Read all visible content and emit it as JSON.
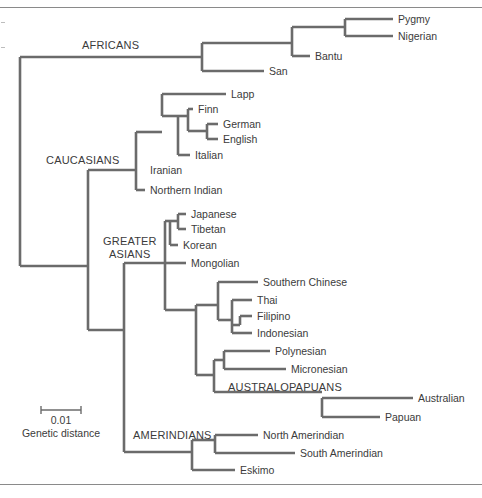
{
  "figure": {
    "width": 482,
    "height": 498,
    "line_color": "#6b6b6b",
    "text_color": "#3b3b3b",
    "rule_color": "#8a8a8a",
    "background": "#ffffff"
  },
  "scale_bar": {
    "value_label": "0.01",
    "caption": "Genetic distance",
    "x_start": 41,
    "x_end": 81,
    "y": 410,
    "value_label_y": 424,
    "caption_y": 437
  },
  "group_labels": [
    {
      "id": "africans",
      "text": "AFRICANS",
      "x": 82,
      "y": 49
    },
    {
      "id": "caucasians",
      "text": "CAUCASIANS",
      "x": 46,
      "y": 164
    },
    {
      "id": "greater-asians-line1",
      "text": "GREATER",
      "x": 103,
      "y": 245
    },
    {
      "id": "greater-asians-line2",
      "text": "ASIANS",
      "x": 109,
      "y": 258
    },
    {
      "id": "australopapuans",
      "text": "AUSTRALOPAPUANS",
      "x": 228,
      "y": 391
    },
    {
      "id": "amerindians",
      "text": "AMERINDIANS",
      "x": 133,
      "y": 439
    }
  ],
  "chart_data": {
    "type": "tree",
    "scale": {
      "bar_length_px": 40,
      "bar_value": 0.01,
      "units": "genetic distance"
    },
    "root": {
      "x": 20,
      "y_top": 57,
      "y_bottom": 266
    },
    "clades": [
      "AFRICANS",
      "CAUCASIANS",
      "GREATER ASIANS",
      "AUSTRALOPAPUANS",
      "AMERINDIANS"
    ],
    "taxa": [
      {
        "name": "Pygmy",
        "group": "AFRICANS",
        "tip_x": 393,
        "y": 19,
        "branch_x": 345,
        "label_x": 398
      },
      {
        "name": "Nigerian",
        "group": "AFRICANS",
        "tip_x": 393,
        "y": 36,
        "branch_x": 345,
        "label_x": 398
      },
      {
        "name": "Bantu",
        "group": "AFRICANS",
        "tip_x": 310,
        "y": 56,
        "branch_x": 292,
        "label_x": 315
      },
      {
        "name": "San",
        "group": "AFRICANS",
        "tip_x": 264,
        "y": 71,
        "branch_x": 202,
        "label_x": 269
      },
      {
        "name": "Lapp",
        "group": "CAUCASIANS",
        "tip_x": 226,
        "y": 94,
        "branch_x": 162,
        "label_x": 231
      },
      {
        "name": "Finn",
        "group": "CAUCASIANS",
        "tip_x": 193,
        "y": 109,
        "branch_x": 188,
        "label_x": 198
      },
      {
        "name": "German",
        "group": "CAUCASIANS",
        "tip_x": 218,
        "y": 124,
        "branch_x": 207,
        "label_x": 223
      },
      {
        "name": "English",
        "group": "CAUCASIANS",
        "tip_x": 218,
        "y": 139,
        "branch_x": 207,
        "label_x": 223
      },
      {
        "name": "Italian",
        "group": "CAUCASIANS",
        "tip_x": 190,
        "y": 155,
        "branch_x": 178,
        "label_x": 195
      },
      {
        "name": "Iranian",
        "group": "CAUCASIANS",
        "tip_x": 145,
        "y": 170,
        "branch_x": 136,
        "label_x": 150
      },
      {
        "name": "Northern Indian",
        "group": "CAUCASIANS",
        "tip_x": 145,
        "y": 190,
        "branch_x": 136,
        "label_x": 150
      },
      {
        "name": "Japanese",
        "group": "GREATER ASIANS",
        "tip_x": 186,
        "y": 214,
        "branch_x": 178,
        "label_x": 191
      },
      {
        "name": "Tibetan",
        "group": "GREATER ASIANS",
        "tip_x": 186,
        "y": 229,
        "branch_x": 178,
        "label_x": 191
      },
      {
        "name": "Korean",
        "group": "GREATER ASIANS",
        "tip_x": 178,
        "y": 245,
        "branch_x": 170,
        "label_x": 183
      },
      {
        "name": "Mongolian",
        "group": "GREATER ASIANS",
        "tip_x": 186,
        "y": 263,
        "branch_x": 165,
        "label_x": 191
      },
      {
        "name": "Southern Chinese",
        "group": "GREATER ASIANS",
        "tip_x": 258,
        "y": 282,
        "branch_x": 218,
        "label_x": 263
      },
      {
        "name": "Thai",
        "group": "GREATER ASIANS",
        "tip_x": 252,
        "y": 300,
        "branch_x": 232,
        "label_x": 257
      },
      {
        "name": "Filipino",
        "group": "GREATER ASIANS",
        "tip_x": 252,
        "y": 316,
        "branch_x": 240,
        "label_x": 257
      },
      {
        "name": "Indonesian",
        "group": "GREATER ASIANS",
        "tip_x": 252,
        "y": 333,
        "branch_x": 232,
        "label_x": 257
      },
      {
        "name": "Polynesian",
        "group": "GREATER ASIANS",
        "tip_x": 270,
        "y": 351,
        "branch_x": 224,
        "label_x": 275
      },
      {
        "name": "Micronesian",
        "group": "GREATER ASIANS",
        "tip_x": 286,
        "y": 369,
        "branch_x": 224,
        "label_x": 291
      },
      {
        "name": "Australian",
        "group": "AUSTRALOPAPUANS",
        "tip_x": 413,
        "y": 398,
        "branch_x": 322,
        "label_x": 418
      },
      {
        "name": "Papuan",
        "group": "AUSTRALOPAPUANS",
        "tip_x": 380,
        "y": 417,
        "branch_x": 322,
        "label_x": 385
      },
      {
        "name": "North Amerindian",
        "group": "AMERINDIANS",
        "tip_x": 258,
        "y": 435,
        "branch_x": 215,
        "label_x": 263
      },
      {
        "name": "South Amerindian",
        "group": "AMERINDIANS",
        "tip_x": 295,
        "y": 453,
        "branch_x": 192,
        "label_x": 300
      },
      {
        "name": "Eskimo",
        "group": "AMERINDIANS",
        "tip_x": 235,
        "y": 470,
        "branch_x": 168,
        "label_x": 240
      }
    ],
    "internal_nodes": [
      {
        "id": "root",
        "x": 20,
        "y_top": 57,
        "y_bottom": 266,
        "parent_x": 20
      },
      {
        "id": "africans",
        "x": 202,
        "y_top": 43,
        "y_bottom": 71,
        "parent_x": 20,
        "parent_y": 57
      },
      {
        "id": "bantu-clade",
        "x": 292,
        "y_top": 27,
        "y_bottom": 56,
        "parent_x": 202,
        "parent_y": 43
      },
      {
        "id": "pygmy-nigerian",
        "x": 345,
        "y_top": 19,
        "y_bottom": 36,
        "parent_x": 292,
        "parent_y": 27
      },
      {
        "id": "non-african",
        "x": 88,
        "y_top": 170,
        "y_bottom": 393,
        "parent_x": 20,
        "parent_y": 266
      },
      {
        "id": "caucasians",
        "x": 136,
        "y_top": 132,
        "y_bottom": 190,
        "parent_x": 88,
        "parent_y": 170
      },
      {
        "id": "caucasian-core",
        "x": 162,
        "y_top": 94,
        "y_bottom": 155,
        "parent_x": 136,
        "parent_y": 132
      },
      {
        "id": "euro-cluster",
        "x": 178,
        "y_top": 116,
        "y_bottom": 155,
        "parent_x": 162,
        "parent_y": 116
      },
      {
        "id": "finn-gereng",
        "x": 188,
        "y_top": 109,
        "y_bottom": 131,
        "parent_x": 178,
        "parent_y": 116
      },
      {
        "id": "german-english",
        "x": 207,
        "y_top": 124,
        "y_bottom": 139,
        "parent_x": 188,
        "parent_y": 131
      },
      {
        "id": "asian-amerind",
        "x": 124,
        "y_top": 263,
        "y_bottom": 452,
        "parent_x": 88,
        "parent_y": 330
      },
      {
        "id": "greater-asians",
        "x": 165,
        "y_top": 229,
        "y_bottom": 310,
        "parent_x": 124,
        "parent_y": 263
      },
      {
        "id": "ne-asians",
        "x": 170,
        "y_top": 221,
        "y_bottom": 245,
        "parent_x": 165,
        "parent_y": 229
      },
      {
        "id": "jap-tib",
        "x": 178,
        "y_top": 214,
        "y_bottom": 229,
        "parent_x": 170,
        "parent_y": 221
      },
      {
        "id": "se-asia-oceania",
        "x": 196,
        "y_top": 305,
        "y_bottom": 392,
        "parent_x": 165,
        "parent_y": 310
      },
      {
        "id": "se-asians",
        "x": 218,
        "y_top": 282,
        "y_bottom": 320,
        "parent_x": 196,
        "parent_y": 305
      },
      {
        "id": "thai-fil-indo",
        "x": 232,
        "y_top": 300,
        "y_bottom": 333,
        "parent_x": 218,
        "parent_y": 320
      },
      {
        "id": "fil-indo",
        "x": 240,
        "y_top": 316,
        "y_bottom": 325,
        "parent_x": 232,
        "parent_y": 325
      },
      {
        "id": "oceania",
        "x": 214,
        "y_top": 360,
        "y_bottom": 392,
        "parent_x": 196,
        "parent_y": 375
      },
      {
        "id": "poly-micro",
        "x": 224,
        "y_top": 351,
        "y_bottom": 369,
        "parent_x": 214,
        "parent_y": 360
      },
      {
        "id": "australopapuans",
        "x": 322,
        "y_top": 398,
        "y_bottom": 417,
        "parent_x": 214,
        "parent_y": 392
      },
      {
        "id": "amerindians",
        "x": 192,
        "y_top": 440,
        "y_bottom": 470,
        "parent_x": 124,
        "parent_y": 452
      },
      {
        "id": "north-south",
        "x": 215,
        "y_top": 435,
        "y_bottom": 453,
        "parent_x": 192,
        "parent_y": 440
      }
    ],
    "horizontal_edges": [
      {
        "from_x": 20,
        "to_x": 202,
        "y": 57
      },
      {
        "from_x": 202,
        "to_x": 292,
        "y": 43
      },
      {
        "from_x": 202,
        "to_x": 264,
        "y": 71
      },
      {
        "from_x": 292,
        "to_x": 345,
        "y": 27
      },
      {
        "from_x": 292,
        "to_x": 310,
        "y": 56
      },
      {
        "from_x": 345,
        "to_x": 393,
        "y": 19
      },
      {
        "from_x": 345,
        "to_x": 393,
        "y": 36
      },
      {
        "from_x": 20,
        "to_x": 88,
        "y": 266
      },
      {
        "from_x": 88,
        "to_x": 136,
        "y": 170
      },
      {
        "from_x": 88,
        "to_x": 124,
        "y": 330
      },
      {
        "from_x": 136,
        "to_x": 162,
        "y": 132
      },
      {
        "from_x": 136,
        "to_x": 145,
        "y": 190
      },
      {
        "from_x": 162,
        "to_x": 226,
        "y": 94
      },
      {
        "from_x": 162,
        "to_x": 178,
        "y": 116
      },
      {
        "from_x": 178,
        "to_x": 188,
        "y": 116
      },
      {
        "from_x": 178,
        "to_x": 190,
        "y": 155
      },
      {
        "from_x": 188,
        "to_x": 193,
        "y": 109
      },
      {
        "from_x": 188,
        "to_x": 207,
        "y": 131
      },
      {
        "from_x": 207,
        "to_x": 218,
        "y": 124
      },
      {
        "from_x": 207,
        "to_x": 218,
        "y": 139
      },
      {
        "from_x": 124,
        "to_x": 165,
        "y": 263
      },
      {
        "from_x": 165,
        "to_x": 170,
        "y": 221
      },
      {
        "from_x": 165,
        "to_x": 196,
        "y": 310
      },
      {
        "from_x": 170,
        "to_x": 178,
        "y": 221
      },
      {
        "from_x": 170,
        "to_x": 178,
        "y": 245
      },
      {
        "from_x": 178,
        "to_x": 186,
        "y": 214
      },
      {
        "from_x": 178,
        "to_x": 186,
        "y": 229
      },
      {
        "from_x": 165,
        "to_x": 186,
        "y": 263
      },
      {
        "from_x": 196,
        "to_x": 218,
        "y": 305
      },
      {
        "from_x": 196,
        "to_x": 214,
        "y": 375
      },
      {
        "from_x": 218,
        "to_x": 258,
        "y": 282
      },
      {
        "from_x": 218,
        "to_x": 232,
        "y": 320
      },
      {
        "from_x": 232,
        "to_x": 252,
        "y": 300
      },
      {
        "from_x": 232,
        "to_x": 240,
        "y": 325
      },
      {
        "from_x": 240,
        "to_x": 252,
        "y": 316
      },
      {
        "from_x": 232,
        "to_x": 252,
        "y": 333
      },
      {
        "from_x": 214,
        "to_x": 224,
        "y": 360
      },
      {
        "from_x": 224,
        "to_x": 270,
        "y": 351
      },
      {
        "from_x": 224,
        "to_x": 286,
        "y": 369
      },
      {
        "from_x": 214,
        "to_x": 322,
        "y": 392
      },
      {
        "from_x": 322,
        "to_x": 413,
        "y": 398
      },
      {
        "from_x": 322,
        "to_x": 380,
        "y": 417
      },
      {
        "from_x": 124,
        "to_x": 192,
        "y": 452
      },
      {
        "from_x": 192,
        "to_x": 215,
        "y": 440
      },
      {
        "from_x": 192,
        "to_x": 235,
        "y": 470
      },
      {
        "from_x": 215,
        "to_x": 258,
        "y": 435
      },
      {
        "from_x": 215,
        "to_x": 295,
        "y": 453
      }
    ],
    "vertical_edges": [
      {
        "x": 20,
        "y_top": 57,
        "y_bottom": 266
      },
      {
        "x": 202,
        "y_top": 43,
        "y_bottom": 71
      },
      {
        "x": 292,
        "y_top": 27,
        "y_bottom": 56
      },
      {
        "x": 345,
        "y_top": 19,
        "y_bottom": 36
      },
      {
        "x": 88,
        "y_top": 170,
        "y_bottom": 330
      },
      {
        "x": 136,
        "y_top": 132,
        "y_bottom": 190
      },
      {
        "x": 162,
        "y_top": 94,
        "y_bottom": 116
      },
      {
        "x": 178,
        "y_top": 116,
        "y_bottom": 155
      },
      {
        "x": 188,
        "y_top": 109,
        "y_bottom": 131
      },
      {
        "x": 207,
        "y_top": 124,
        "y_bottom": 139
      },
      {
        "x": 124,
        "y_top": 263,
        "y_bottom": 452
      },
      {
        "x": 165,
        "y_top": 221,
        "y_bottom": 310
      },
      {
        "x": 170,
        "y_top": 221,
        "y_bottom": 245
      },
      {
        "x": 178,
        "y_top": 214,
        "y_bottom": 229
      },
      {
        "x": 196,
        "y_top": 305,
        "y_bottom": 375
      },
      {
        "x": 218,
        "y_top": 282,
        "y_bottom": 320
      },
      {
        "x": 232,
        "y_top": 300,
        "y_bottom": 333
      },
      {
        "x": 240,
        "y_top": 316,
        "y_bottom": 325
      },
      {
        "x": 214,
        "y_top": 360,
        "y_bottom": 392
      },
      {
        "x": 224,
        "y_top": 351,
        "y_bottom": 369
      },
      {
        "x": 322,
        "y_top": 398,
        "y_bottom": 417
      },
      {
        "x": 192,
        "y_top": 440,
        "y_bottom": 470
      },
      {
        "x": 215,
        "y_top": 435,
        "y_bottom": 453
      }
    ]
  }
}
